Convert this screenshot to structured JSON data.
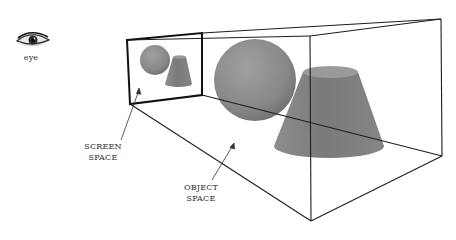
{
  "diagram": {
    "labels": {
      "eye": "eye",
      "screen_space": [
        "SCREEN",
        "SPACE"
      ],
      "object_space": [
        "OBJECT",
        "SPACE"
      ]
    },
    "colors": {
      "line": "#1e1e1e",
      "shape_fill": "#8a8a8a",
      "shape_dark": "#6e6e6e",
      "shape_light": "#a8a8a8",
      "background": "#ffffff"
    },
    "frustum": {
      "near_plane": [
        [
          127,
          40
        ],
        [
          202,
          33
        ],
        [
          202,
          95
        ],
        [
          130,
          104
        ]
      ],
      "far_plane": [
        [
          310,
          36
        ],
        [
          441,
          19
        ],
        [
          442,
          156
        ],
        [
          311,
          221
        ]
      ]
    },
    "objects": {
      "screen_sphere": {
        "cx": 155,
        "cy": 60,
        "r": 15
      },
      "screen_cone": {
        "top": [
          173,
          186,
          57
        ],
        "bottom": [
          165,
          192,
          84
        ]
      },
      "object_sphere": {
        "cx": 255,
        "cy": 80,
        "r": 41
      },
      "object_cone": {
        "top": [
          303,
          358,
          72
        ],
        "bottom": [
          274,
          384,
          146
        ]
      }
    }
  }
}
